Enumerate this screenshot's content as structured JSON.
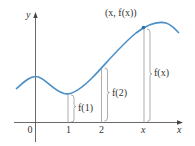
{
  "diagram": {
    "type": "function-graph",
    "colors": {
      "curve": "#4a8fc7",
      "axes": "#444444",
      "guides": "#8a8a8a",
      "text": "#333333"
    },
    "axes": {
      "x_label": "x",
      "y_label": "y"
    },
    "ticks": [
      {
        "label": "0"
      },
      {
        "label": "1"
      },
      {
        "label": "2"
      },
      {
        "label": "x"
      }
    ],
    "point": {
      "label": "(x, f(x))"
    },
    "heights": [
      {
        "label": "f(1)"
      },
      {
        "label": "f(2)"
      },
      {
        "label": "f(x)"
      }
    ]
  }
}
